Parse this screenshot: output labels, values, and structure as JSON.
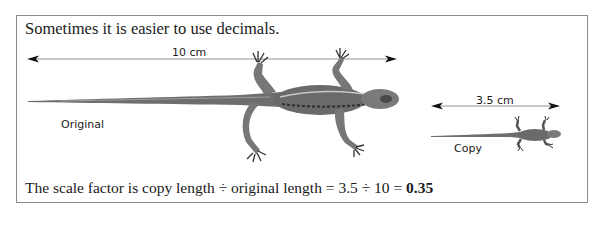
{
  "intro_text": "Sometimes it is easier to use decimals.",
  "original": {
    "measurement": "10 cm",
    "label": "Original"
  },
  "copy": {
    "measurement": "3.5 cm",
    "label": "Copy"
  },
  "formula": {
    "text": "The scale factor is copy length ÷ original length = 3.5 ÷ 10 = ",
    "result": "0.35"
  },
  "icons": {
    "original_image": "lizard-illustration-large",
    "copy_image": "lizard-illustration-small",
    "arrow": "double-headed-arrow"
  }
}
